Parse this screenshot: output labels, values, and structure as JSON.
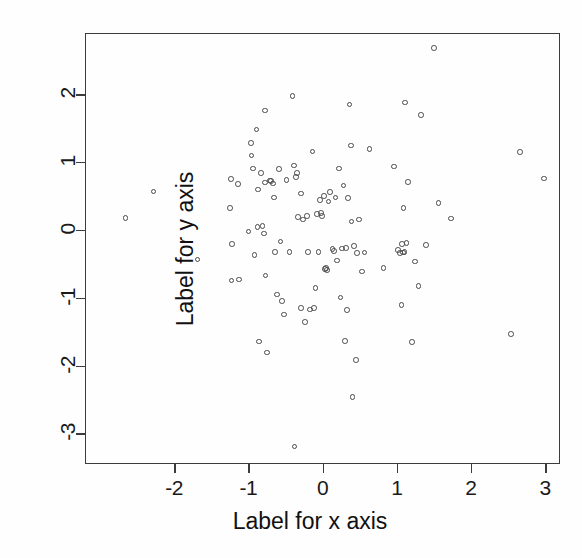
{
  "chart_data": {
    "type": "scatter",
    "title": "",
    "xlabel": "Label for x axis",
    "ylabel": "Label for y axis",
    "xticks": [
      -2,
      -1,
      0,
      1,
      2,
      3
    ],
    "yticks": [
      2,
      1,
      0,
      -1,
      -2,
      -3
    ],
    "xtick_labels": [
      "-2",
      "-1",
      "0",
      "1",
      "2",
      "3"
    ],
    "ytick_labels": [
      "2",
      "1",
      "0",
      "-1",
      "-2",
      "-3"
    ],
    "xlim": [
      -3.2,
      3.2
    ],
    "ylim": [
      -3.45,
      2.9
    ],
    "grid": false,
    "legend": null,
    "marker": "open-circle",
    "marker_color": "#4a4a4a",
    "n_points": 110,
    "series": [
      {
        "name": "points",
        "points": [
          [
            -2.67,
            0.19
          ],
          [
            -2.29,
            0.58
          ],
          [
            -1.7,
            -0.42
          ],
          [
            -1.26,
            0.34
          ],
          [
            -1.25,
            0.76
          ],
          [
            -1.24,
            -0.73
          ],
          [
            -1.23,
            -0.19
          ],
          [
            -1.15,
            0.69
          ],
          [
            -1.14,
            -0.72
          ],
          [
            -1.01,
            -0.01
          ],
          [
            -0.98,
            1.29
          ],
          [
            -0.97,
            1.11
          ],
          [
            -0.95,
            0.92
          ],
          [
            -0.93,
            -0.36
          ],
          [
            -0.9,
            1.49
          ],
          [
            -0.89,
            0.06
          ],
          [
            -0.88,
            0.61
          ],
          [
            -0.87,
            -1.63
          ],
          [
            -0.84,
            0.85
          ],
          [
            -0.82,
            0.07
          ],
          [
            -0.8,
            -0.04
          ],
          [
            -0.79,
            1.77
          ],
          [
            -0.79,
            0.71
          ],
          [
            -0.78,
            -0.66
          ],
          [
            -0.76,
            -1.79
          ],
          [
            -0.72,
            0.74
          ],
          [
            -0.71,
            0.73
          ],
          [
            -0.67,
            0.49
          ],
          [
            -0.65,
            -0.31
          ],
          [
            -0.63,
            -0.94
          ],
          [
            -0.6,
            0.91
          ],
          [
            -0.58,
            -0.16
          ],
          [
            -0.56,
            -1.03
          ],
          [
            -0.53,
            -1.23
          ],
          [
            -0.46,
            -0.31
          ],
          [
            -0.42,
            1.99
          ],
          [
            -0.4,
            0.96
          ],
          [
            -0.39,
            -3.18
          ],
          [
            -0.37,
            0.79
          ],
          [
            -0.36,
            0.85
          ],
          [
            -0.34,
            0.2
          ],
          [
            -0.3,
            0.55
          ],
          [
            -0.28,
            0.17
          ],
          [
            -0.25,
            -1.34
          ],
          [
            -0.22,
            0.22
          ],
          [
            -0.21,
            -0.31
          ],
          [
            -0.18,
            -1.16
          ],
          [
            -0.15,
            1.17
          ],
          [
            -0.13,
            -1.14
          ],
          [
            -0.11,
            -0.84
          ],
          [
            -0.07,
            -0.31
          ],
          [
            -0.05,
            0.45
          ],
          [
            -0.03,
            0.26
          ],
          [
            -0.02,
            0.22
          ],
          [
            0.01,
            0.51
          ],
          [
            0.03,
            -0.55
          ],
          [
            0.05,
            -0.58
          ],
          [
            0.07,
            0.43
          ],
          [
            0.09,
            0.57
          ],
          [
            0.12,
            -0.27
          ],
          [
            0.14,
            -0.3
          ],
          [
            0.18,
            -0.44
          ],
          [
            0.21,
            0.92
          ],
          [
            0.23,
            -0.98
          ],
          [
            0.25,
            -0.26
          ],
          [
            0.27,
            0.67
          ],
          [
            0.29,
            -1.62
          ],
          [
            0.32,
            -1.17
          ],
          [
            0.35,
            1.86
          ],
          [
            0.37,
            1.26
          ],
          [
            0.38,
            0.14
          ],
          [
            0.39,
            -2.45
          ],
          [
            0.41,
            -0.22
          ],
          [
            0.44,
            -1.9
          ],
          [
            0.48,
            0.17
          ],
          [
            0.52,
            -0.6
          ],
          [
            0.55,
            -0.32
          ],
          [
            0.62,
            1.21
          ],
          [
            0.81,
            -0.55
          ],
          [
            0.95,
            0.95
          ],
          [
            1.0,
            -0.28
          ],
          [
            1.03,
            -0.33
          ],
          [
            1.05,
            -1.09
          ],
          [
            1.06,
            -0.19
          ],
          [
            1.08,
            0.34
          ],
          [
            1.09,
            -0.31
          ],
          [
            1.1,
            1.89
          ],
          [
            1.12,
            -0.18
          ],
          [
            1.14,
            0.72
          ],
          [
            1.19,
            -1.64
          ],
          [
            1.23,
            -0.45
          ],
          [
            1.28,
            -0.81
          ],
          [
            1.31,
            1.71
          ],
          [
            1.38,
            -0.21
          ],
          [
            1.49,
            2.69
          ],
          [
            1.55,
            0.41
          ],
          [
            1.72,
            0.18
          ],
          [
            2.65,
            1.16
          ],
          [
            2.53,
            -1.52
          ],
          [
            2.97,
            0.77
          ],
          [
            -0.68,
            0.7
          ],
          [
            -0.5,
            0.75
          ],
          [
            0.16,
            0.49
          ],
          [
            0.33,
            0.48
          ],
          [
            -0.09,
            0.25
          ],
          [
            0.02,
            -0.56
          ],
          [
            0.45,
            -0.33
          ],
          [
            1.07,
            -0.32
          ],
          [
            -0.3,
            -1.14
          ],
          [
            0.3,
            -0.25
          ]
        ]
      }
    ]
  }
}
